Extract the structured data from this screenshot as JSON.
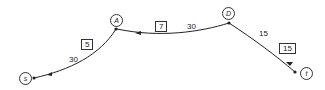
{
  "diagram": {
    "type": "flow-network",
    "nodes": [
      {
        "id": "s",
        "label": "s"
      },
      {
        "id": "A",
        "label": "A"
      },
      {
        "id": "D",
        "label": "D"
      },
      {
        "id": "t",
        "label": "t"
      }
    ],
    "edges": [
      {
        "from": "A",
        "to": "s",
        "capacity": "30",
        "flow": "5"
      },
      {
        "from": "D",
        "to": "A",
        "capacity": "30",
        "flow": "7"
      },
      {
        "from": "D",
        "to": "t",
        "capacity": "15",
        "flow": "15"
      }
    ],
    "colors": {
      "line": "#222222",
      "background": "#ffffff"
    }
  }
}
